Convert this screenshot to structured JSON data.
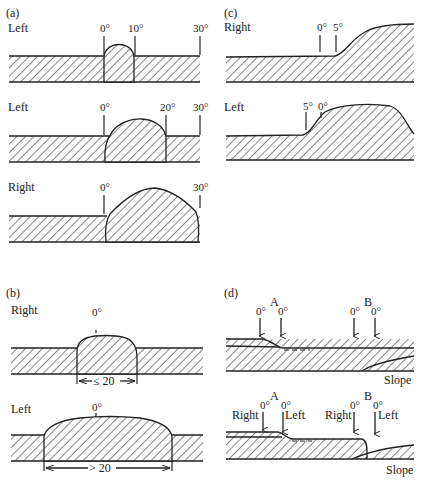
{
  "panels": {
    "a": {
      "label": "(a)",
      "rows": [
        {
          "side": "Left",
          "ticks": [
            "0°",
            "10°",
            "30°"
          ]
        },
        {
          "side": "Left",
          "ticks": [
            "0°",
            "20°",
            "30°"
          ]
        },
        {
          "side": "Right",
          "ticks": [
            "0°",
            "30°"
          ]
        }
      ]
    },
    "b": {
      "label": "(b)",
      "rows": [
        {
          "side": "Right",
          "tick": "0°",
          "dimension": "≤ 20"
        },
        {
          "side": "Left",
          "tick": "0°",
          "dimension": "> 20"
        }
      ]
    },
    "c": {
      "label": "(c)",
      "rows": [
        {
          "side": "Right",
          "ticks": [
            "0°",
            "5°"
          ]
        },
        {
          "side": "Left",
          "ticks": [
            "5°",
            "0°"
          ]
        }
      ]
    },
    "d": {
      "label": "(d)",
      "rows": [
        {
          "points": [
            "A",
            "B"
          ],
          "arrows": [
            "0°",
            "0°",
            "0°",
            "0°"
          ],
          "caption": "Slope"
        },
        {
          "points": [
            "A",
            "B"
          ],
          "arrows": [
            "0°",
            "0°",
            "0°",
            "0°"
          ],
          "sides": [
            "Right",
            "Left",
            "Right",
            "Left"
          ],
          "caption": "Slope"
        }
      ]
    }
  }
}
